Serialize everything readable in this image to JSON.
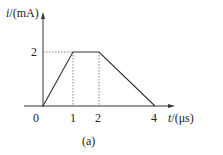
{
  "diagram": {
    "y_axis_label_var": "i",
    "y_axis_label_unit": "/(mA)",
    "x_axis_label_var": "t",
    "x_axis_label_unit": "/(μs)",
    "origin_label": "0",
    "x_ticks": [
      "1",
      "2",
      "4"
    ],
    "y_ticks": [
      "2"
    ],
    "caption": "(a)",
    "waveform_points": [
      [
        0,
        0
      ],
      [
        1,
        2
      ],
      [
        2,
        2
      ],
      [
        4,
        0
      ]
    ]
  }
}
